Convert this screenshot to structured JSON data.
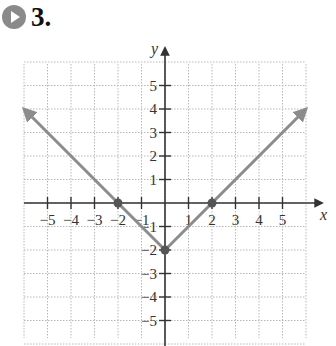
{
  "header": {
    "icon": "play-circle-icon",
    "problem_number": "3."
  },
  "chart_data": {
    "type": "line",
    "title": "",
    "xlabel": "x",
    "ylabel": "y",
    "xlim": [
      -6,
      6
    ],
    "ylim": [
      -6,
      6
    ],
    "grid": true,
    "x_ticks": [
      -5,
      -4,
      -3,
      -2,
      -1,
      1,
      2,
      3,
      4,
      5
    ],
    "y_ticks": [
      -5,
      -4,
      -3,
      -2,
      -1,
      1,
      2,
      3,
      4,
      5
    ],
    "x_tick_labels": [
      "−5",
      "−4",
      "−3",
      "−2",
      "−1",
      "1",
      "2",
      "3",
      "4",
      "5"
    ],
    "y_tick_labels": [
      "−5",
      "−4",
      "−3",
      "−2",
      "−1",
      "1",
      "2",
      "3",
      "4",
      "5"
    ],
    "series": [
      {
        "name": "f(x) = |x| − 2",
        "x": [
          -6,
          -2,
          0,
          2,
          6
        ],
        "y": [
          4,
          0,
          -2,
          0,
          4
        ],
        "color": "#8c8c8c",
        "arrows_at_ends": true
      }
    ],
    "marked_points": [
      {
        "x": -2,
        "y": 0
      },
      {
        "x": 0,
        "y": -2
      },
      {
        "x": 2,
        "y": 0
      }
    ]
  },
  "colors": {
    "axis": "#333333",
    "grid": "#b8b8b8",
    "graph": "#8c8c8c",
    "icon": "#8a8a8a"
  }
}
